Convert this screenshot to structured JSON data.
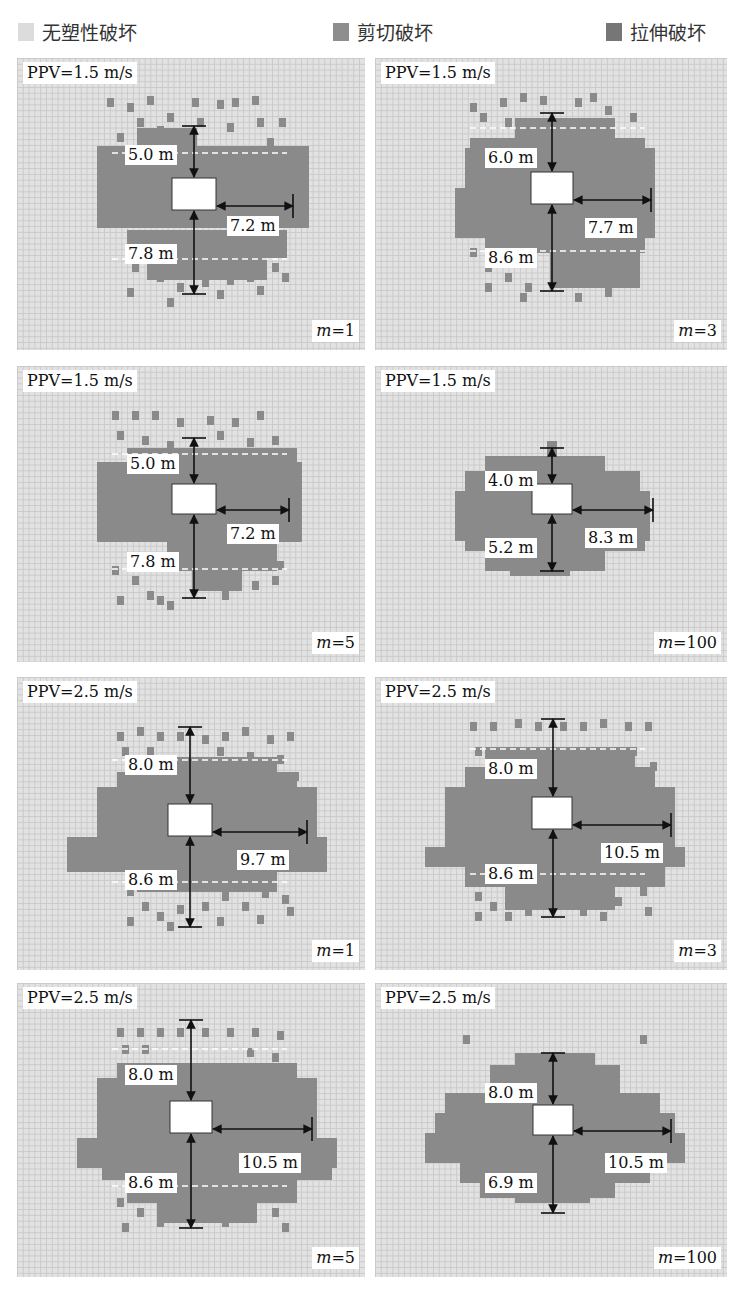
{
  "legend": [
    {
      "label": "无塑性破坏",
      "color": "#dcdcdc",
      "x": 18
    },
    {
      "label": "剪切破坏",
      "color": "#8e8e8e",
      "x": 333
    },
    {
      "label": "拉伸破坏",
      "color": "#767676",
      "x": 606
    }
  ],
  "colors": {
    "background": "#e2e2e2",
    "damage": "#8a8a8a",
    "tunnel": "#ffffff",
    "arrow": "#111111",
    "dashed": "#ffffff"
  },
  "panels": [
    {
      "id": "p1",
      "ppv": "PPV=1.5 m/s",
      "m_var": "m",
      "m_value": "=1",
      "x": 17,
      "y": 58,
      "w": 348,
      "h": 292,
      "tunnel": {
        "x": 155,
        "y": 120,
        "w": 44,
        "h": 32
      },
      "top": {
        "label": "5.0 m",
        "x1": 177,
        "y1": 68,
        "lx": 108,
        "ly": 87
      },
      "bottom": {
        "label": "7.8 m",
        "x1": 177,
        "y1": 236,
        "lx": 108,
        "ly": 186
      },
      "right": {
        "label": "7.2 m",
        "x2": 276,
        "lx": 210,
        "ly": 158
      },
      "dash_top": 95,
      "dash_bottom": 201,
      "blocks": [
        [
          80,
          88,
          212,
          82
        ],
        [
          120,
          70,
          60,
          20
        ],
        [
          110,
          172,
          160,
          28
        ],
        [
          130,
          200,
          120,
          22
        ]
      ],
      "cells": [
        [
          90,
          40
        ],
        [
          110,
          45
        ],
        [
          130,
          38
        ],
        [
          150,
          55
        ],
        [
          175,
          40
        ],
        [
          200,
          42
        ],
        [
          215,
          40
        ],
        [
          235,
          38
        ],
        [
          262,
          60
        ],
        [
          240,
          60
        ],
        [
          210,
          65
        ],
        [
          180,
          60
        ],
        [
          100,
          75
        ],
        [
          120,
          60
        ],
        [
          140,
          68
        ],
        [
          250,
          80
        ],
        [
          262,
          92
        ],
        [
          245,
          100
        ],
        [
          115,
          205
        ],
        [
          140,
          215
        ],
        [
          160,
          225
        ],
        [
          185,
          220
        ],
        [
          210,
          218
        ],
        [
          230,
          215
        ],
        [
          255,
          205
        ],
        [
          265,
          215
        ],
        [
          110,
          230
        ],
        [
          150,
          240
        ],
        [
          200,
          232
        ],
        [
          240,
          228
        ]
      ]
    },
    {
      "id": "p2",
      "ppv": "PPV=1.5 m/s",
      "m_var": "m",
      "m_value": "=3",
      "x": 375,
      "y": 58,
      "w": 352,
      "h": 292,
      "tunnel": {
        "x": 156,
        "y": 114,
        "w": 42,
        "h": 32
      },
      "top": {
        "label": "6.0 m",
        "x1": 177,
        "y1": 55,
        "lx": 110,
        "ly": 90
      },
      "bottom": {
        "label": "8.6 m",
        "x1": 177,
        "y1": 233,
        "lx": 110,
        "ly": 190
      },
      "right": {
        "label": "7.7 m",
        "x2": 276,
        "lx": 210,
        "ly": 160
      },
      "dash_top": 70,
      "dash_bottom": 193,
      "blocks": [
        [
          90,
          90,
          190,
          70
        ],
        [
          80,
          130,
          200,
          50
        ],
        [
          95,
          80,
          175,
          20
        ],
        [
          110,
          160,
          160,
          35
        ],
        [
          140,
          60,
          100,
          30
        ],
        [
          175,
          190,
          90,
          40
        ]
      ],
      "cells": [
        [
          95,
          45
        ],
        [
          125,
          40
        ],
        [
          145,
          35
        ],
        [
          165,
          38
        ],
        [
          200,
          40
        ],
        [
          215,
          35
        ],
        [
          230,
          48
        ],
        [
          255,
          55
        ],
        [
          105,
          55
        ],
        [
          130,
          60
        ],
        [
          225,
          70
        ],
        [
          260,
          95
        ],
        [
          95,
          190
        ],
        [
          110,
          205
        ],
        [
          130,
          215
        ],
        [
          150,
          225
        ],
        [
          220,
          205
        ],
        [
          240,
          210
        ],
        [
          255,
          195
        ],
        [
          110,
          225
        ],
        [
          145,
          235
        ],
        [
          200,
          235
        ],
        [
          230,
          230
        ]
      ]
    },
    {
      "id": "p3",
      "ppv": "PPV=1.5 m/s",
      "m_var": "m",
      "m_value": "=5",
      "x": 17,
      "y": 366,
      "w": 348,
      "h": 296,
      "tunnel": {
        "x": 155,
        "y": 118,
        "w": 44,
        "h": 30
      },
      "top": {
        "label": "5.0 m",
        "x1": 177,
        "y1": 72,
        "lx": 110,
        "ly": 88
      },
      "bottom": {
        "label": "7.8 m",
        "x1": 177,
        "y1": 232,
        "lx": 110,
        "ly": 186
      },
      "right": {
        "label": "7.2 m",
        "x2": 272,
        "lx": 210,
        "ly": 158
      },
      "dash_top": 88,
      "dash_bottom": 203,
      "blocks": [
        [
          80,
          96,
          205,
          80
        ],
        [
          110,
          82,
          170,
          20
        ],
        [
          150,
          175,
          110,
          30
        ],
        [
          175,
          205,
          50,
          20
        ]
      ],
      "cells": [
        [
          95,
          45
        ],
        [
          115,
          45
        ],
        [
          135,
          45
        ],
        [
          160,
          52
        ],
        [
          190,
          50
        ],
        [
          215,
          52
        ],
        [
          240,
          45
        ],
        [
          100,
          65
        ],
        [
          125,
          70
        ],
        [
          150,
          75
        ],
        [
          200,
          65
        ],
        [
          230,
          72
        ],
        [
          255,
          70
        ],
        [
          95,
          200
        ],
        [
          115,
          210
        ],
        [
          130,
          225
        ],
        [
          150,
          235
        ],
        [
          205,
          225
        ],
        [
          235,
          215
        ],
        [
          255,
          210
        ],
        [
          260,
          195
        ],
        [
          100,
          230
        ],
        [
          140,
          230
        ]
      ]
    },
    {
      "id": "p4",
      "ppv": "PPV=1.5 m/s",
      "m_var": "m",
      "m_value": "=100",
      "x": 375,
      "y": 366,
      "w": 352,
      "h": 296,
      "tunnel": {
        "x": 157,
        "y": 118,
        "w": 40,
        "h": 30
      },
      "top": {
        "label": "4.0 m",
        "x1": 177,
        "y1": 82,
        "lx": 110,
        "ly": 105
      },
      "bottom": {
        "label": "5.2 m",
        "x1": 177,
        "y1": 205,
        "lx": 110,
        "ly": 172
      },
      "right": {
        "label": "8.3 m",
        "x2": 278,
        "lx": 210,
        "ly": 162
      },
      "dash_top": 0,
      "dash_bottom": 0,
      "blocks": [
        [
          110,
          90,
          120,
          20
        ],
        [
          90,
          105,
          175,
          20
        ],
        [
          80,
          125,
          195,
          50
        ],
        [
          90,
          170,
          180,
          15
        ],
        [
          110,
          185,
          120,
          20
        ],
        [
          135,
          200,
          60,
          10
        ],
        [
          172,
          75,
          10,
          15
        ]
      ],
      "cells": []
    },
    {
      "id": "p5",
      "ppv": "PPV=2.5 m/s",
      "m_var": "m",
      "m_value": "=1",
      "x": 17,
      "y": 677,
      "w": 348,
      "h": 293,
      "tunnel": {
        "x": 151,
        "y": 127,
        "w": 44,
        "h": 32
      },
      "top": {
        "label": "8.0 m",
        "x1": 173,
        "y1": 50,
        "lx": 108,
        "ly": 78
      },
      "bottom": {
        "label": "8.6 m",
        "x1": 173,
        "y1": 250,
        "lx": 108,
        "ly": 193
      },
      "right": {
        "label": "9.7 m",
        "x2": 290,
        "lx": 220,
        "ly": 173
      },
      "dash_top": 83,
      "dash_bottom": 205,
      "blocks": [
        [
          80,
          110,
          220,
          60
        ],
        [
          50,
          160,
          260,
          35
        ],
        [
          100,
          95,
          180,
          20
        ],
        [
          130,
          80,
          130,
          20
        ],
        [
          120,
          195,
          140,
          20
        ]
      ],
      "cells": [
        [
          100,
          55
        ],
        [
          120,
          50
        ],
        [
          140,
          55
        ],
        [
          160,
          55
        ],
        [
          185,
          58
        ],
        [
          205,
          55
        ],
        [
          225,
          50
        ],
        [
          250,
          58
        ],
        [
          270,
          55
        ],
        [
          105,
          70
        ],
        [
          130,
          70
        ],
        [
          200,
          70
        ],
        [
          230,
          75
        ],
        [
          260,
          78
        ],
        [
          275,
          95
        ],
        [
          110,
          210
        ],
        [
          125,
          225
        ],
        [
          140,
          235
        ],
        [
          160,
          228
        ],
        [
          185,
          225
        ],
        [
          205,
          215
        ],
        [
          225,
          225
        ],
        [
          245,
          212
        ],
        [
          265,
          218
        ],
        [
          110,
          240
        ],
        [
          150,
          245
        ],
        [
          200,
          240
        ],
        [
          240,
          238
        ],
        [
          270,
          230
        ]
      ]
    },
    {
      "id": "p6",
      "ppv": "PPV=2.5 m/s",
      "m_var": "m",
      "m_value": "=3",
      "x": 375,
      "y": 677,
      "w": 352,
      "h": 293,
      "tunnel": {
        "x": 157,
        "y": 120,
        "w": 40,
        "h": 32
      },
      "top": {
        "label": "8.0 m",
        "x1": 178,
        "y1": 42,
        "lx": 110,
        "ly": 82
      },
      "bottom": {
        "label": "8.6 m",
        "x1": 178,
        "y1": 240,
        "lx": 110,
        "ly": 187
      },
      "right": {
        "label": "10.5 m",
        "x2": 296,
        "lx": 226,
        "ly": 166
      },
      "dash_top": 72,
      "dash_bottom": 197,
      "blocks": [
        [
          70,
          110,
          230,
          60
        ],
        [
          50,
          170,
          260,
          20
        ],
        [
          90,
          90,
          190,
          25
        ],
        [
          110,
          70,
          150,
          25
        ],
        [
          90,
          190,
          200,
          20
        ],
        [
          130,
          208,
          110,
          25
        ]
      ],
      "cells": [
        [
          95,
          45
        ],
        [
          115,
          45
        ],
        [
          140,
          42
        ],
        [
          160,
          45
        ],
        [
          185,
          45
        ],
        [
          205,
          45
        ],
        [
          225,
          42
        ],
        [
          250,
          45
        ],
        [
          270,
          45
        ],
        [
          100,
          70
        ],
        [
          255,
          70
        ],
        [
          275,
          85
        ],
        [
          100,
          215
        ],
        [
          115,
          225
        ],
        [
          130,
          235
        ],
        [
          150,
          230
        ],
        [
          205,
          230
        ],
        [
          225,
          235
        ],
        [
          240,
          220
        ],
        [
          265,
          210
        ],
        [
          100,
          235
        ],
        [
          270,
          230
        ]
      ]
    },
    {
      "id": "p7",
      "ppv": "PPV=2.5 m/s",
      "m_var": "m",
      "m_value": "=5",
      "x": 17,
      "y": 983,
      "w": 348,
      "h": 294,
      "tunnel": {
        "x": 153,
        "y": 118,
        "w": 42,
        "h": 32
      },
      "top": {
        "label": "8.0 m",
        "x1": 174,
        "y1": 37,
        "lx": 108,
        "ly": 82
      },
      "bottom": {
        "label": "8.6 m",
        "x1": 174,
        "y1": 245,
        "lx": 108,
        "ly": 190
      },
      "right": {
        "label": "10.5 m",
        "x2": 295,
        "lx": 222,
        "ly": 170
      },
      "dash_top": 66,
      "dash_bottom": 203,
      "blocks": [
        [
          80,
          95,
          220,
          70
        ],
        [
          60,
          155,
          260,
          30
        ],
        [
          100,
          80,
          180,
          20
        ],
        [
          110,
          195,
          170,
          25
        ],
        [
          140,
          215,
          100,
          25
        ],
        [
          85,
          185,
          230,
          12
        ]
      ],
      "cells": [
        [
          100,
          45
        ],
        [
          120,
          45
        ],
        [
          140,
          45
        ],
        [
          160,
          45
        ],
        [
          185,
          45
        ],
        [
          210,
          45
        ],
        [
          235,
          45
        ],
        [
          260,
          48
        ],
        [
          105,
          62
        ],
        [
          125,
          62
        ],
        [
          230,
          65
        ],
        [
          255,
          70
        ],
        [
          100,
          215
        ],
        [
          120,
          225
        ],
        [
          140,
          235
        ],
        [
          205,
          235
        ],
        [
          230,
          230
        ],
        [
          255,
          225
        ],
        [
          265,
          240
        ],
        [
          105,
          240
        ]
      ]
    },
    {
      "id": "p8",
      "ppv": "PPV=2.5 m/s",
      "m_var": "m",
      "m_value": "=100",
      "x": 375,
      "y": 983,
      "w": 352,
      "h": 294,
      "tunnel": {
        "x": 158,
        "y": 122,
        "w": 40,
        "h": 30
      },
      "top": {
        "label": "8.0 m",
        "x1": 178,
        "y1": 70,
        "lx": 110,
        "ly": 100
      },
      "bottom": {
        "label": "6.9 m",
        "x1": 178,
        "y1": 230,
        "lx": 110,
        "ly": 190
      },
      "right": {
        "label": "10.5 m",
        "x2": 296,
        "lx": 230,
        "ly": 170
      },
      "dash_top": 0,
      "dash_bottom": 0,
      "blocks": [
        [
          140,
          70,
          80,
          15
        ],
        [
          115,
          82,
          130,
          30
        ],
        [
          70,
          110,
          215,
          40
        ],
        [
          60,
          130,
          240,
          20
        ],
        [
          50,
          150,
          260,
          30
        ],
        [
          85,
          180,
          190,
          20
        ],
        [
          105,
          200,
          135,
          15
        ],
        [
          140,
          208,
          75,
          12
        ]
      ],
      "cells": [
        [
          88,
          52
        ],
        [
          265,
          52
        ]
      ]
    }
  ]
}
